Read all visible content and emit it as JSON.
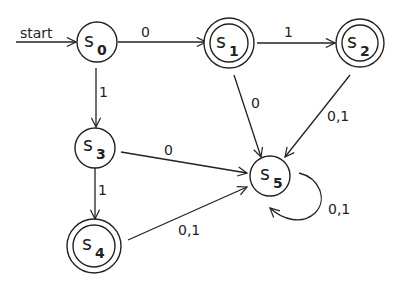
{
  "diagram": {
    "type": "finite-state-automaton",
    "start_label": "start",
    "states": [
      {
        "id": "s0",
        "letter": "s",
        "sub": "0",
        "accepting": false,
        "start": true
      },
      {
        "id": "s1",
        "letter": "s",
        "sub": "1",
        "accepting": true
      },
      {
        "id": "s2",
        "letter": "s",
        "sub": "2",
        "accepting": true
      },
      {
        "id": "s3",
        "letter": "s",
        "sub": "3",
        "accepting": false
      },
      {
        "id": "s4",
        "letter": "s",
        "sub": "4",
        "accepting": true
      },
      {
        "id": "s5",
        "letter": "s",
        "sub": "5",
        "accepting": false
      }
    ],
    "transitions": [
      {
        "from": "s0",
        "to": "s1",
        "label": "0"
      },
      {
        "from": "s0",
        "to": "s3",
        "label": "1"
      },
      {
        "from": "s1",
        "to": "s2",
        "label": "1"
      },
      {
        "from": "s1",
        "to": "s5",
        "label": "0"
      },
      {
        "from": "s2",
        "to": "s5",
        "label": "0,1"
      },
      {
        "from": "s3",
        "to": "s5",
        "label": "0"
      },
      {
        "from": "s3",
        "to": "s4",
        "label": "1"
      },
      {
        "from": "s4",
        "to": "s5",
        "label": "0,1"
      },
      {
        "from": "s5",
        "to": "s5",
        "label": "0,1"
      }
    ]
  }
}
